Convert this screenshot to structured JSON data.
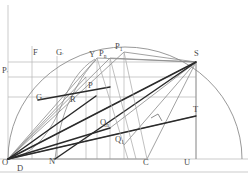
{
  "figure": {
    "type": "geometry-diagram",
    "title": "",
    "background": "#ffffff",
    "colors": {
      "thin_line": "#9a9a9a",
      "medium_line": "#6f6f6f",
      "thick_line": "#2a2a2a",
      "arc": "#8d8d8d",
      "label": "#4a4a4a"
    },
    "labels": [
      {
        "id": "O",
        "text": "O",
        "sub": "",
        "x": 2,
        "y": 164
      },
      {
        "id": "D",
        "text": "D",
        "sub": "",
        "x": 17,
        "y": 170
      },
      {
        "id": "N",
        "text": "N",
        "sub": "",
        "x": 49,
        "y": 163
      },
      {
        "id": "C",
        "text": "C",
        "sub": "",
        "x": 143,
        "y": 164
      },
      {
        "id": "U",
        "text": "U",
        "sub": "",
        "x": 184,
        "y": 164
      },
      {
        "id": "F",
        "text": "F",
        "sub": "",
        "x": 33,
        "y": 54
      },
      {
        "id": "Gp",
        "text": "G",
        "sub": "′",
        "x": 56,
        "y": 54
      },
      {
        "id": "Pp",
        "text": "P",
        "sub": "′",
        "x": 2,
        "y": 72
      },
      {
        "id": "G",
        "text": "G",
        "sub": "",
        "x": 36,
        "y": 99
      },
      {
        "id": "R",
        "text": "R",
        "sub": "",
        "x": 70,
        "y": 101
      },
      {
        "id": "Y",
        "text": "Y",
        "sub": "",
        "x": 89,
        "y": 55
      },
      {
        "id": "Pn",
        "text": "P",
        "sub": "n",
        "x": 99,
        "y": 54
      },
      {
        "id": "P1",
        "text": "P",
        "sub": "1",
        "x": 115,
        "y": 48
      },
      {
        "id": "P",
        "text": "P",
        "sub": "",
        "x": 88,
        "y": 87
      },
      {
        "id": "Qn",
        "text": "Q",
        "sub": "n",
        "x": 100,
        "y": 124
      },
      {
        "id": "Q1",
        "text": "Q",
        "sub": "1",
        "x": 115,
        "y": 141
      },
      {
        "id": "S",
        "text": "S",
        "sub": "",
        "x": 194,
        "y": 55
      },
      {
        "id": "T",
        "text": "T",
        "sub": "",
        "x": 193,
        "y": 111
      }
    ],
    "geometry": {
      "origin": {
        "x": 8,
        "y": 159
      },
      "baseline_y": 159,
      "arc_center_x": 110,
      "arc_radius": 117
    }
  }
}
